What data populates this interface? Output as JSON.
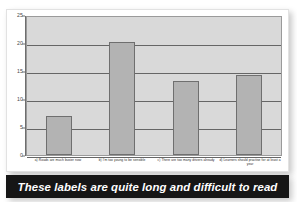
{
  "figure": {
    "top_cutoff_text": "",
    "background_color": "#ffffff"
  },
  "caption": {
    "text": "These labels are quite long and difficult to read",
    "background_color": "#161616",
    "text_color": "#ffffff"
  },
  "chart_data": {
    "type": "bar",
    "title": "",
    "subtitle": "",
    "xlabel": "",
    "ylabel": "",
    "categories": [
      "a) Roads are much busier now",
      "b) I'm too young to be sensible",
      "c) There are too many drivers already",
      "d) Learners should practise for at least a year"
    ],
    "values": [
      7.0,
      20.1,
      13.2,
      14.3
    ],
    "ylim": [
      0,
      25
    ],
    "yticks": [
      0,
      5,
      10,
      15,
      20,
      25
    ],
    "ytick_labels": [
      "0",
      "5",
      "10",
      "15",
      "20",
      "25"
    ],
    "grid": true,
    "grid_axis": "y",
    "legend": false,
    "legend_position": "none",
    "series": [
      {
        "name": "Responses",
        "values": [
          7.0,
          20.1,
          13.2,
          14.3
        ]
      }
    ],
    "colors": {
      "bar_fill": "#b3b3b3",
      "bar_edge": "#6f6f6f",
      "plot_background": "#d9d9d9",
      "gridline": "#666666",
      "axis_line": "#6e6e6e",
      "tick_text": "#4a4a4a",
      "label_text": "#2b2b2b"
    }
  }
}
